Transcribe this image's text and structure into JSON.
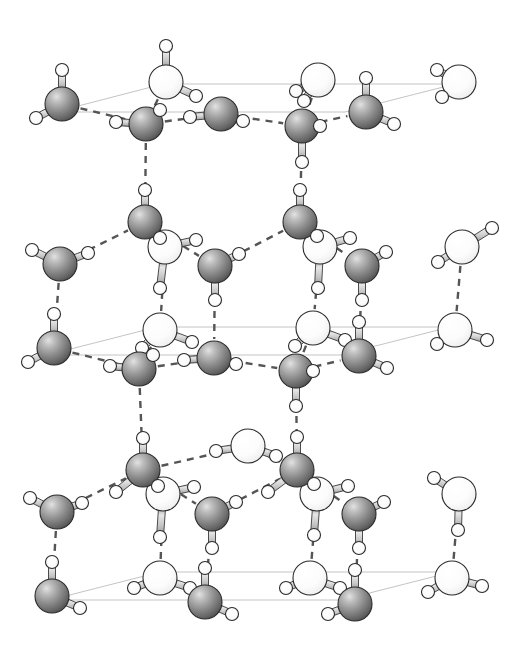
{
  "figure": {
    "width": 527,
    "height": 648,
    "background_color": "#ffffff"
  },
  "legend": {
    "oxygen_dark_label": "oxygen (lower sublattice)",
    "oxygen_light_label": "oxygen (upper sublattice)",
    "hydrogen_label": "hydrogen",
    "covalent_bond_label": "covalent O-H bond",
    "hydrogen_bond_label": "hydrogen bond",
    "unit_cell_label": "unit cell outline"
  },
  "style": {
    "oxygen_dark_fill": "#8a8a8a",
    "oxygen_dark_highlight": "#d8d8d8",
    "oxygen_dark_shadow": "#4a4a4a",
    "oxygen_light_fill": "#fbfbfb",
    "oxygen_light_highlight": "#ffffff",
    "oxygen_light_shadow": "#c8c8c8",
    "hydrogen_fill": "#fdfdfd",
    "hydrogen_stroke": "#2a2a2a",
    "bond_fill": "#c4c4c4",
    "bond_stroke": "#3a3a3a",
    "hbond_color": "#555555",
    "cell_line_color": "#bdbdbd",
    "outline_color": "#2b2b2b",
    "oxygen_radius": 17,
    "hydrogen_radius": 6.5,
    "bond_width": 7,
    "hbond_dash": "7 6",
    "hbond_width": 2.4,
    "cell_line_width": 0.9
  },
  "unit_cells": [
    {
      "name": "top-cell",
      "points": "55,112 163,84 455,84 345,112"
    },
    {
      "name": "middle-cell",
      "points": "47,355 157,327 450,327 340,355"
    },
    {
      "name": "bottom-cell",
      "points": "50,600 160,572 452,572 342,600"
    }
  ],
  "oxygens": [
    {
      "id": "o-t1",
      "x": 62,
      "y": 104,
      "type": "dark"
    },
    {
      "id": "o-t2",
      "x": 146,
      "y": 124,
      "type": "dark"
    },
    {
      "id": "o-t3",
      "x": 221,
      "y": 114,
      "type": "dark"
    },
    {
      "id": "o-t4",
      "x": 302,
      "y": 126,
      "type": "dark"
    },
    {
      "id": "o-t5",
      "x": 366,
      "y": 112,
      "type": "dark"
    },
    {
      "id": "o-t6",
      "x": 166,
      "y": 82,
      "type": "light"
    },
    {
      "id": "o-t7",
      "x": 318,
      "y": 80,
      "type": "light"
    },
    {
      "id": "o-t8",
      "x": 459,
      "y": 82,
      "type": "light"
    },
    {
      "id": "o-m1",
      "x": 60,
      "y": 264,
      "type": "dark"
    },
    {
      "id": "o-m2",
      "x": 145,
      "y": 222,
      "type": "dark"
    },
    {
      "id": "o-m3",
      "x": 215,
      "y": 266,
      "type": "dark"
    },
    {
      "id": "o-m4",
      "x": 300,
      "y": 222,
      "type": "dark"
    },
    {
      "id": "o-m5",
      "x": 362,
      "y": 266,
      "type": "dark"
    },
    {
      "id": "o-m6",
      "x": 165,
      "y": 247,
      "type": "light"
    },
    {
      "id": "o-m7",
      "x": 320,
      "y": 247,
      "type": "light"
    },
    {
      "id": "o-m8",
      "x": 462,
      "y": 247,
      "type": "light"
    },
    {
      "id": "o-n1",
      "x": 54,
      "y": 348,
      "type": "dark"
    },
    {
      "id": "o-n2",
      "x": 139,
      "y": 369,
      "type": "dark"
    },
    {
      "id": "o-n3",
      "x": 214,
      "y": 358,
      "type": "dark"
    },
    {
      "id": "o-n4",
      "x": 296,
      "y": 371,
      "type": "dark"
    },
    {
      "id": "o-n5",
      "x": 359,
      "y": 356,
      "type": "dark"
    },
    {
      "id": "o-n6",
      "x": 160,
      "y": 330,
      "type": "light"
    },
    {
      "id": "o-n7",
      "x": 313,
      "y": 328,
      "type": "light"
    },
    {
      "id": "o-n8",
      "x": 455,
      "y": 330,
      "type": "light"
    },
    {
      "id": "o-b1",
      "x": 57,
      "y": 512,
      "type": "dark"
    },
    {
      "id": "o-b2",
      "x": 143,
      "y": 470,
      "type": "dark"
    },
    {
      "id": "o-b3",
      "x": 212,
      "y": 514,
      "type": "dark"
    },
    {
      "id": "o-b4",
      "x": 297,
      "y": 470,
      "type": "dark"
    },
    {
      "id": "o-b5",
      "x": 359,
      "y": 514,
      "type": "dark"
    },
    {
      "id": "o-b6",
      "x": 163,
      "y": 494,
      "type": "light"
    },
    {
      "id": "o-b7",
      "x": 317,
      "y": 494,
      "type": "light"
    },
    {
      "id": "o-b8",
      "x": 459,
      "y": 494,
      "type": "light"
    },
    {
      "id": "o-b9",
      "x": 248,
      "y": 446,
      "type": "light"
    },
    {
      "id": "o-z1",
      "x": 52,
      "y": 596,
      "type": "dark"
    },
    {
      "id": "o-z2",
      "x": 205,
      "y": 602,
      "type": "dark"
    },
    {
      "id": "o-z3",
      "x": 355,
      "y": 604,
      "type": "dark"
    },
    {
      "id": "o-z4",
      "x": 160,
      "y": 578,
      "type": "light"
    },
    {
      "id": "o-z5",
      "x": 310,
      "y": 578,
      "type": "light"
    },
    {
      "id": "o-z6",
      "x": 452,
      "y": 578,
      "type": "light"
    }
  ],
  "hydrogens": [
    {
      "id": "h-t1a",
      "x": 62,
      "y": 70,
      "on": "o-t1"
    },
    {
      "id": "h-t1b",
      "x": 36,
      "y": 118,
      "on": "o-t1"
    },
    {
      "id": "h-t2a",
      "x": 116,
      "y": 122,
      "on": "o-t2"
    },
    {
      "id": "h-t2b",
      "x": 160,
      "y": 110,
      "on": "o-t2"
    },
    {
      "id": "h-t3a",
      "x": 190,
      "y": 117,
      "on": "o-t3"
    },
    {
      "id": "h-t3b",
      "x": 243,
      "y": 121,
      "on": "o-t3"
    },
    {
      "id": "h-t4a",
      "x": 302,
      "y": 162,
      "on": "o-t4"
    },
    {
      "id": "h-t4b",
      "x": 320,
      "y": 126,
      "on": "o-t4"
    },
    {
      "id": "h-t5a",
      "x": 366,
      "y": 78,
      "on": "o-t5"
    },
    {
      "id": "h-t5b",
      "x": 394,
      "y": 124,
      "on": "o-t5"
    },
    {
      "id": "h-t6a",
      "x": 166,
      "y": 46,
      "on": "o-t6"
    },
    {
      "id": "h-t6b",
      "x": 196,
      "y": 96,
      "on": "o-t6"
    },
    {
      "id": "h-t7a",
      "x": 296,
      "y": 91,
      "on": "o-t7"
    },
    {
      "id": "h-t7b",
      "x": 304,
      "y": 101,
      "on": "o-t7"
    },
    {
      "id": "h-t8a",
      "x": 437,
      "y": 70,
      "on": "o-t8"
    },
    {
      "id": "h-t8b",
      "x": 442,
      "y": 97,
      "on": "o-t8"
    },
    {
      "id": "h-m1a",
      "x": 32,
      "y": 250,
      "on": "o-m1"
    },
    {
      "id": "h-m1b",
      "x": 88,
      "y": 253,
      "on": "o-m1"
    },
    {
      "id": "h-m2a",
      "x": 145,
      "y": 190,
      "on": "o-m2"
    },
    {
      "id": "h-m2b",
      "x": 160,
      "y": 238,
      "on": "o-m2"
    },
    {
      "id": "h-m3a",
      "x": 239,
      "y": 254,
      "on": "o-m3"
    },
    {
      "id": "h-m3b",
      "x": 215,
      "y": 300,
      "on": "o-m3"
    },
    {
      "id": "h-m4a",
      "x": 300,
      "y": 190,
      "on": "o-m4"
    },
    {
      "id": "h-m4b",
      "x": 317,
      "y": 236,
      "on": "o-m4"
    },
    {
      "id": "h-m5a",
      "x": 386,
      "y": 252,
      "on": "o-m5"
    },
    {
      "id": "h-m5b",
      "x": 362,
      "y": 300,
      "on": "o-m5"
    },
    {
      "id": "h-m6a",
      "x": 196,
      "y": 240,
      "on": "o-m6"
    },
    {
      "id": "h-m6b",
      "x": 160,
      "y": 288,
      "on": "o-m6"
    },
    {
      "id": "h-m7a",
      "x": 350,
      "y": 238,
      "on": "o-m7"
    },
    {
      "id": "h-m7b",
      "x": 318,
      "y": 288,
      "on": "o-m7"
    },
    {
      "id": "h-m8a",
      "x": 492,
      "y": 228,
      "on": "o-m8"
    },
    {
      "id": "h-m8b",
      "x": 438,
      "y": 262,
      "on": "o-m8"
    },
    {
      "id": "h-n1a",
      "x": 54,
      "y": 314,
      "on": "o-n1"
    },
    {
      "id": "h-n1b",
      "x": 28,
      "y": 362,
      "on": "o-n1"
    },
    {
      "id": "h-n2a",
      "x": 110,
      "y": 366,
      "on": "o-n2"
    },
    {
      "id": "h-n2b",
      "x": 153,
      "y": 355,
      "on": "o-n2"
    },
    {
      "id": "h-n3a",
      "x": 184,
      "y": 360,
      "on": "o-n3"
    },
    {
      "id": "h-n3b",
      "x": 236,
      "y": 364,
      "on": "o-n3"
    },
    {
      "id": "h-n4a",
      "x": 296,
      "y": 406,
      "on": "o-n4"
    },
    {
      "id": "h-n4b",
      "x": 313,
      "y": 371,
      "on": "o-n4"
    },
    {
      "id": "h-n5a",
      "x": 359,
      "y": 322,
      "on": "o-n5"
    },
    {
      "id": "h-n5b",
      "x": 387,
      "y": 368,
      "on": "o-n5"
    },
    {
      "id": "h-n6a",
      "x": 192,
      "y": 342,
      "on": "o-n6"
    },
    {
      "id": "h-n6b",
      "x": 142,
      "y": 348,
      "on": "o-n6"
    },
    {
      "id": "h-n7a",
      "x": 345,
      "y": 340,
      "on": "o-n7"
    },
    {
      "id": "h-n7b",
      "x": 295,
      "y": 346,
      "on": "o-n7"
    },
    {
      "id": "h-n8a",
      "x": 487,
      "y": 340,
      "on": "o-n8"
    },
    {
      "id": "h-n8b",
      "x": 437,
      "y": 344,
      "on": "o-n8"
    },
    {
      "id": "h-b1a",
      "x": 30,
      "y": 498,
      "on": "o-b1"
    },
    {
      "id": "h-b1b",
      "x": 82,
      "y": 503,
      "on": "o-b1"
    },
    {
      "id": "h-b2a",
      "x": 143,
      "y": 438,
      "on": "o-b2"
    },
    {
      "id": "h-b2b",
      "x": 158,
      "y": 486,
      "on": "o-b2"
    },
    {
      "id": "h-b2c",
      "x": 116,
      "y": 492,
      "on": "o-b2"
    },
    {
      "id": "h-b3a",
      "x": 236,
      "y": 502,
      "on": "o-b3"
    },
    {
      "id": "h-b3b",
      "x": 212,
      "y": 548,
      "on": "o-b3"
    },
    {
      "id": "h-b4a",
      "x": 297,
      "y": 437,
      "on": "o-b4"
    },
    {
      "id": "h-b4b",
      "x": 314,
      "y": 484,
      "on": "o-b4"
    },
    {
      "id": "h-b4c",
      "x": 268,
      "y": 492,
      "on": "o-b4"
    },
    {
      "id": "h-b5a",
      "x": 384,
      "y": 502,
      "on": "o-b5"
    },
    {
      "id": "h-b5b",
      "x": 359,
      "y": 548,
      "on": "o-b5"
    },
    {
      "id": "h-b6a",
      "x": 194,
      "y": 487,
      "on": "o-b6"
    },
    {
      "id": "h-b6b",
      "x": 160,
      "y": 537,
      "on": "o-b6"
    },
    {
      "id": "h-b7a",
      "x": 348,
      "y": 486,
      "on": "o-b7"
    },
    {
      "id": "h-b7b",
      "x": 314,
      "y": 535,
      "on": "o-b7"
    },
    {
      "id": "h-b8a",
      "x": 434,
      "y": 478,
      "on": "o-b8"
    },
    {
      "id": "h-b8b",
      "x": 458,
      "y": 530,
      "on": "o-b8"
    },
    {
      "id": "h-b9a",
      "x": 216,
      "y": 451,
      "on": "o-b9"
    },
    {
      "id": "h-b9b",
      "x": 276,
      "y": 456,
      "on": "o-b9"
    },
    {
      "id": "h-z1a",
      "x": 52,
      "y": 562,
      "on": "o-z1"
    },
    {
      "id": "h-z1b",
      "x": 80,
      "y": 608,
      "on": "o-z1"
    },
    {
      "id": "h-z2a",
      "x": 205,
      "y": 568,
      "on": "o-z2"
    },
    {
      "id": "h-z2b",
      "x": 232,
      "y": 614,
      "on": "o-z2"
    },
    {
      "id": "h-z3a",
      "x": 355,
      "y": 570,
      "on": "o-z3"
    },
    {
      "id": "h-z3b",
      "x": 328,
      "y": 614,
      "on": "o-z3"
    },
    {
      "id": "h-z4a",
      "x": 190,
      "y": 588,
      "on": "o-z4"
    },
    {
      "id": "h-z4b",
      "x": 134,
      "y": 588,
      "on": "o-z4"
    },
    {
      "id": "h-z5a",
      "x": 340,
      "y": 588,
      "on": "o-z5"
    },
    {
      "id": "h-z5b",
      "x": 286,
      "y": 588,
      "on": "o-z5"
    },
    {
      "id": "h-z6a",
      "x": 482,
      "y": 586,
      "on": "o-z6"
    },
    {
      "id": "h-z6b",
      "x": 428,
      "y": 592,
      "on": "o-z6"
    }
  ],
  "covalent_bonds": [
    [
      "o-t1",
      "h-t1a"
    ],
    [
      "o-t1",
      "h-t1b"
    ],
    [
      "o-t2",
      "h-t2a"
    ],
    [
      "o-t2",
      "h-t2b"
    ],
    [
      "o-t3",
      "h-t3a"
    ],
    [
      "o-t3",
      "h-t3b"
    ],
    [
      "o-t4",
      "h-t4a"
    ],
    [
      "o-t4",
      "h-t4b"
    ],
    [
      "o-t5",
      "h-t5a"
    ],
    [
      "o-t5",
      "h-t5b"
    ],
    [
      "o-t6",
      "h-t6a"
    ],
    [
      "o-t6",
      "h-t6b"
    ],
    [
      "o-t7",
      "h-t7a"
    ],
    [
      "o-t7",
      "h-t7b"
    ],
    [
      "o-t8",
      "h-t8a"
    ],
    [
      "o-t8",
      "h-t8b"
    ],
    [
      "o-m1",
      "h-m1a"
    ],
    [
      "o-m1",
      "h-m1b"
    ],
    [
      "o-m2",
      "h-m2a"
    ],
    [
      "o-m2",
      "h-m2b"
    ],
    [
      "o-m3",
      "h-m3a"
    ],
    [
      "o-m3",
      "h-m3b"
    ],
    [
      "o-m4",
      "h-m4a"
    ],
    [
      "o-m4",
      "h-m4b"
    ],
    [
      "o-m5",
      "h-m5a"
    ],
    [
      "o-m5",
      "h-m5b"
    ],
    [
      "o-m6",
      "h-m6a"
    ],
    [
      "o-m6",
      "h-m6b"
    ],
    [
      "o-m7",
      "h-m7a"
    ],
    [
      "o-m7",
      "h-m7b"
    ],
    [
      "o-m8",
      "h-m8a"
    ],
    [
      "o-m8",
      "h-m8b"
    ],
    [
      "o-n1",
      "h-n1a"
    ],
    [
      "o-n1",
      "h-n1b"
    ],
    [
      "o-n2",
      "h-n2a"
    ],
    [
      "o-n2",
      "h-n2b"
    ],
    [
      "o-n3",
      "h-n3a"
    ],
    [
      "o-n3",
      "h-n3b"
    ],
    [
      "o-n4",
      "h-n4a"
    ],
    [
      "o-n4",
      "h-n4b"
    ],
    [
      "o-n5",
      "h-n5a"
    ],
    [
      "o-n5",
      "h-n5b"
    ],
    [
      "o-n6",
      "h-n6a"
    ],
    [
      "o-n6",
      "h-n6b"
    ],
    [
      "o-n7",
      "h-n7a"
    ],
    [
      "o-n7",
      "h-n7b"
    ],
    [
      "o-n8",
      "h-n8a"
    ],
    [
      "o-n8",
      "h-n8b"
    ],
    [
      "o-b1",
      "h-b1a"
    ],
    [
      "o-b1",
      "h-b1b"
    ],
    [
      "o-b2",
      "h-b2a"
    ],
    [
      "o-b2",
      "h-b2b"
    ],
    [
      "o-b2",
      "h-b2c"
    ],
    [
      "o-b3",
      "h-b3a"
    ],
    [
      "o-b3",
      "h-b3b"
    ],
    [
      "o-b4",
      "h-b4a"
    ],
    [
      "o-b4",
      "h-b4b"
    ],
    [
      "o-b4",
      "h-b4c"
    ],
    [
      "o-b5",
      "h-b5a"
    ],
    [
      "o-b5",
      "h-b5b"
    ],
    [
      "o-b6",
      "h-b6a"
    ],
    [
      "o-b6",
      "h-b6b"
    ],
    [
      "o-b7",
      "h-b7a"
    ],
    [
      "o-b7",
      "h-b7b"
    ],
    [
      "o-b8",
      "h-b8a"
    ],
    [
      "o-b8",
      "h-b8b"
    ],
    [
      "o-b9",
      "h-b9a"
    ],
    [
      "o-b9",
      "h-b9b"
    ],
    [
      "o-z1",
      "h-z1a"
    ],
    [
      "o-z1",
      "h-z1b"
    ],
    [
      "o-z2",
      "h-z2a"
    ],
    [
      "o-z2",
      "h-z2b"
    ],
    [
      "o-z3",
      "h-z3a"
    ],
    [
      "o-z3",
      "h-z3b"
    ],
    [
      "o-z4",
      "h-z4a"
    ],
    [
      "o-z4",
      "h-z4b"
    ],
    [
      "o-z5",
      "h-z5a"
    ],
    [
      "o-z5",
      "h-z5b"
    ],
    [
      "o-z6",
      "h-z6a"
    ],
    [
      "o-z6",
      "h-z6b"
    ]
  ],
  "hydrogen_bonds": [
    [
      "o-t1",
      "o-t2"
    ],
    [
      "o-t2",
      "o-t3"
    ],
    [
      "o-t3",
      "o-t4"
    ],
    [
      "o-t4",
      "o-t5"
    ],
    [
      "o-t6",
      "o-t2"
    ],
    [
      "o-t7",
      "o-t4"
    ],
    [
      "o-t2",
      "o-m2"
    ],
    [
      "o-t4",
      "o-m4"
    ],
    [
      "o-m1",
      "o-m2"
    ],
    [
      "o-m2",
      "o-m3"
    ],
    [
      "o-m3",
      "o-m4"
    ],
    [
      "o-m4",
      "o-m5"
    ],
    [
      "o-m2",
      "o-m6"
    ],
    [
      "o-m4",
      "o-m7"
    ],
    [
      "o-m1",
      "o-n1"
    ],
    [
      "o-m3",
      "o-n3"
    ],
    [
      "o-m5",
      "o-n5"
    ],
    [
      "o-m6",
      "o-n6"
    ],
    [
      "o-m7",
      "o-n7"
    ],
    [
      "o-m8",
      "o-n8"
    ],
    [
      "o-n1",
      "o-n2"
    ],
    [
      "o-n2",
      "o-n3"
    ],
    [
      "o-n3",
      "o-n4"
    ],
    [
      "o-n4",
      "o-n5"
    ],
    [
      "o-n6",
      "o-n2"
    ],
    [
      "o-n7",
      "o-n4"
    ],
    [
      "o-n2",
      "o-b2"
    ],
    [
      "o-n4",
      "o-b4"
    ],
    [
      "o-b1",
      "o-b2"
    ],
    [
      "o-b2",
      "o-b3"
    ],
    [
      "o-b3",
      "o-b4"
    ],
    [
      "o-b4",
      "o-b5"
    ],
    [
      "o-b2",
      "o-b6"
    ],
    [
      "o-b4",
      "o-b7"
    ],
    [
      "o-b2",
      "o-b9"
    ],
    [
      "o-b9",
      "o-b4"
    ],
    [
      "o-b1",
      "o-z1"
    ],
    [
      "o-b3",
      "o-z2"
    ],
    [
      "o-b5",
      "o-z3"
    ],
    [
      "o-b6",
      "o-z4"
    ],
    [
      "o-b7",
      "o-z5"
    ],
    [
      "o-b8",
      "o-z6"
    ]
  ]
}
